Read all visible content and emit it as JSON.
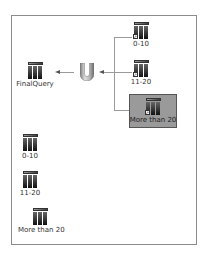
{
  "diagram": {
    "union_symbol": "union-icon",
    "output_node": {
      "label": "FinalQuery",
      "icon": "table-icon"
    },
    "input_nodes": [
      {
        "label": "0-10",
        "icon": "linked-table-icon",
        "selected": false
      },
      {
        "label": "11-20",
        "icon": "linked-table-icon",
        "selected": false
      },
      {
        "label": "More than 20",
        "icon": "linked-table-icon",
        "selected": true
      }
    ],
    "standalone_nodes": [
      {
        "label": "0-10",
        "icon": "table-icon"
      },
      {
        "label": "11-20",
        "icon": "table-icon"
      },
      {
        "label": "More than 20",
        "icon": "table-icon"
      }
    ],
    "colors": {
      "frame_border": "#8c8c8c",
      "connector": "#9a9a9a",
      "selection_fill": "#9a9a9a"
    }
  }
}
